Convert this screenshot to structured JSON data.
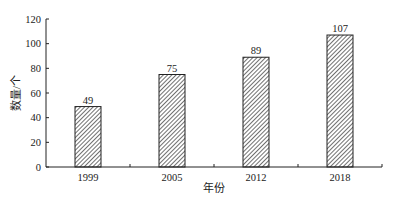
{
  "chart_data": {
    "type": "bar",
    "title": "",
    "xlabel": "年份",
    "ylabel": "数量/个",
    "categories": [
      "1999",
      "2005",
      "2012",
      "2018"
    ],
    "values": [
      49,
      75,
      89,
      107
    ],
    "data_labels": [
      "49",
      "75",
      "89",
      "107"
    ],
    "ylim": [
      0,
      120
    ],
    "yticks": [
      "0",
      "20",
      "40",
      "60",
      "80",
      "100",
      "120"
    ],
    "grid": false,
    "legend": null,
    "bar_style": "diagonal-hatch"
  }
}
